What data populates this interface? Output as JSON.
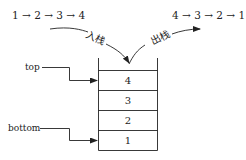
{
  "diagram": {
    "push_sequence": "1 → 2 → 3 → 4",
    "pop_sequence": "4 → 3 → 2 → 1",
    "push_label": "入栈",
    "pop_label": "出栈",
    "pointers": {
      "top": "top",
      "bottom": "bottom"
    },
    "stack_cells": [
      "4",
      "3",
      "2",
      "1"
    ]
  }
}
